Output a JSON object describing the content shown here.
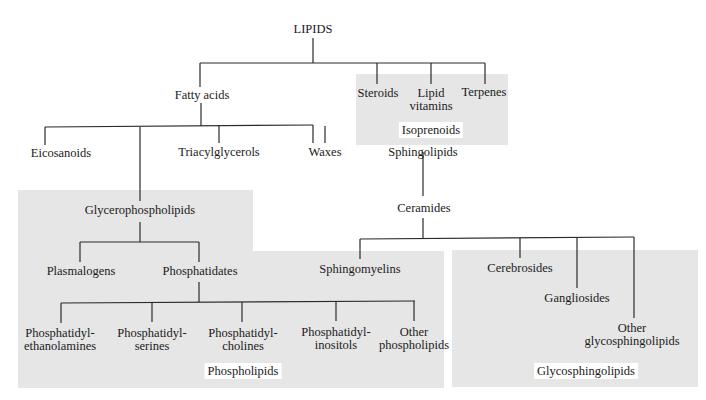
{
  "diagram": {
    "type": "tree",
    "root": "LIPIDS",
    "nodes": {
      "lipids": "LIPIDS",
      "fatty_acids": "Fatty acids",
      "steroids": "Steroids",
      "lipid_vitamins_1": "Lipid",
      "lipid_vitamins_2": "vitamins",
      "terpenes": "Terpenes",
      "eicosanoids": "Eicosanoids",
      "triacylglycerols": "Triacylglycerols",
      "waxes": "Waxes",
      "sphingolipids": "Sphingolipids",
      "glycerophospholipids": "Glycerophospholipids",
      "ceramides": "Ceramides",
      "plasmalogens": "Plasmalogens",
      "phosphatidates": "Phosphatidates",
      "sphingomyelins": "Sphingomyelins",
      "cerebrosides": "Cerebrosides",
      "gangliosides": "Gangliosides",
      "other_glyco_1": "Other",
      "other_glyco_2": "glycosphingolipids",
      "pe_1": "Phosphatidyl-",
      "pe_2": "ethanolamines",
      "ps_1": "Phosphatidyl-",
      "ps_2": "serines",
      "pc_1": "Phosphatidyl-",
      "pc_2": "cholines",
      "pi_1": "Phosphatidyl-",
      "pi_2": "inositols",
      "other_pl_1": "Other",
      "other_pl_2": "phospholipids"
    },
    "groups": {
      "isoprenoids": "Isoprenoids",
      "phospholipids": "Phospholipids",
      "glycosphingolipids": "Glycosphingolipids"
    },
    "edges": [
      [
        "LIPIDS",
        "Fatty acids"
      ],
      [
        "LIPIDS",
        "Steroids"
      ],
      [
        "LIPIDS",
        "Lipid vitamins"
      ],
      [
        "LIPIDS",
        "Terpenes"
      ],
      [
        "Fatty acids",
        "Eicosanoids"
      ],
      [
        "Fatty acids",
        "Glycerophospholipids"
      ],
      [
        "Fatty acids",
        "Triacylglycerols"
      ],
      [
        "Fatty acids",
        "Waxes"
      ],
      [
        "Fatty acids",
        "Sphingolipids"
      ],
      [
        "Glycerophospholipids",
        "Plasmalogens"
      ],
      [
        "Glycerophospholipids",
        "Phosphatidates"
      ],
      [
        "Phosphatidates",
        "Phosphatidylethanolamines"
      ],
      [
        "Phosphatidates",
        "Phosphatidylserines"
      ],
      [
        "Phosphatidates",
        "Phosphatidylcholines"
      ],
      [
        "Phosphatidates",
        "Phosphatidylinositols"
      ],
      [
        "Phosphatidates",
        "Other phospholipids"
      ],
      [
        "Sphingolipids",
        "Ceramides"
      ],
      [
        "Ceramides",
        "Sphingomyelins"
      ],
      [
        "Ceramides",
        "Cerebrosides"
      ],
      [
        "Ceramides",
        "Gangliosides"
      ],
      [
        "Ceramides",
        "Other glycosphingolipids"
      ]
    ],
    "colors": {
      "region_fill": "#e6e6e6",
      "line": "#2a2a2a",
      "background": "#ffffff"
    }
  }
}
